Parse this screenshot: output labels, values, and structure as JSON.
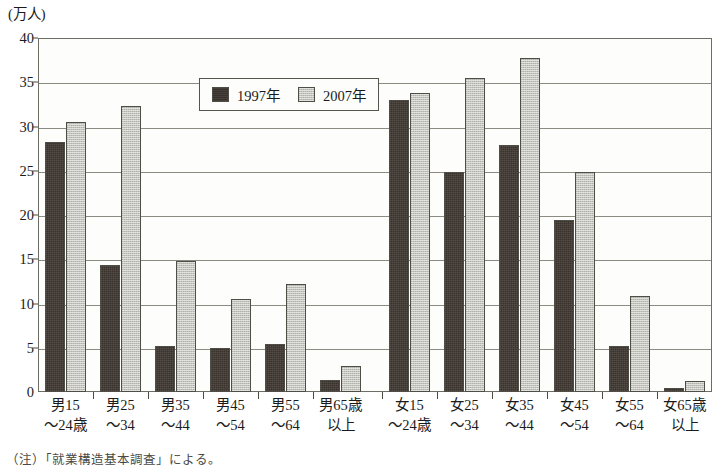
{
  "chart_data": {
    "type": "bar",
    "title": "",
    "unit_label": "(万人)",
    "xlabel": "",
    "ylabel": "",
    "ylim": [
      0,
      40
    ],
    "ytick_step": 5,
    "yticks": [
      0,
      5,
      10,
      15,
      20,
      25,
      30,
      35,
      40
    ],
    "ytick_labels": [
      "0",
      "5",
      "10",
      "15",
      "20",
      "25",
      "30",
      "35",
      "40"
    ],
    "grid": true,
    "legend_position": "upper-center-left",
    "categories": [
      "男15\n～24歳",
      "男25\n～34",
      "男35\n～44",
      "男45\n～54",
      "男55\n～64",
      "男65歳\n以上",
      "女15\n～24歳",
      "女25\n～34",
      "女35\n～44",
      "女45\n～54",
      "女55\n～64",
      "女65歳\n以上"
    ],
    "category_lines": [
      {
        "l1": "男15",
        "l2": "～24歳"
      },
      {
        "l1": "男25",
        "l2": "～34"
      },
      {
        "l1": "男35",
        "l2": "～44"
      },
      {
        "l1": "男45",
        "l2": "～54"
      },
      {
        "l1": "男55",
        "l2": "～64"
      },
      {
        "l1": "男65歳",
        "l2": "以上"
      },
      {
        "l1": "女15",
        "l2": "～24歳"
      },
      {
        "l1": "女25",
        "l2": "～34"
      },
      {
        "l1": "女35",
        "l2": "～44"
      },
      {
        "l1": "女45",
        "l2": "～54"
      },
      {
        "l1": "女55",
        "l2": "～64"
      },
      {
        "l1": "女65歳",
        "l2": "以上"
      }
    ],
    "series": [
      {
        "name": "1997年",
        "color": "#3a322c",
        "values": [
          28.2,
          14.3,
          5.2,
          5.0,
          5.4,
          1.4,
          33.0,
          24.9,
          27.9,
          19.4,
          5.2,
          0.5
        ]
      },
      {
        "name": "2007年",
        "color": "#c3c4bd",
        "values": [
          30.5,
          32.3,
          14.8,
          10.5,
          12.2,
          2.9,
          33.8,
          35.5,
          37.7,
          24.9,
          10.9,
          1.2
        ]
      }
    ]
  },
  "legend": {
    "items": [
      {
        "label": "1997年",
        "key": "s1997"
      },
      {
        "label": "2007年",
        "key": "s2007"
      }
    ]
  },
  "source_note": "（注）「就業構造基本調査」による。"
}
